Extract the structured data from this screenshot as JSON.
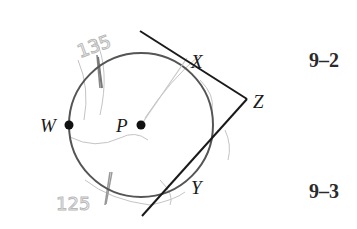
{
  "diagram": {
    "circle": {
      "center_label": "P",
      "cx": 141,
      "cy": 125,
      "r": 72
    },
    "points": {
      "W": {
        "label": "W",
        "x": 68,
        "y": 125
      },
      "P": {
        "label": "P",
        "x": 141,
        "y": 125
      },
      "X": {
        "label": "X",
        "x": 187,
        "y": 57
      },
      "Y": {
        "label": "Y",
        "x": 183,
        "y": 186
      },
      "Z": {
        "label": "Z",
        "x": 247,
        "y": 99
      }
    },
    "tangents": [
      {
        "name": "ZX",
        "x1": 140,
        "y1": 31,
        "x2": 247,
        "y2": 99
      },
      {
        "name": "ZY",
        "x1": 247,
        "y1": 99,
        "x2": 142,
        "y2": 216
      }
    ],
    "pencil_notes": [
      "135",
      "125"
    ],
    "colors": {
      "ink": "#1a1a1a",
      "circle": "#555555",
      "pencil": "#b8b8b8"
    }
  },
  "sections": [
    {
      "label": "9–2"
    },
    {
      "label": "9–3"
    }
  ]
}
